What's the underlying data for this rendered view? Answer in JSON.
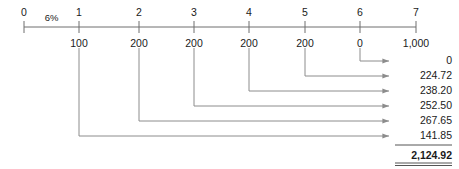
{
  "diagram": {
    "type": "timeline-cash-flow",
    "interest_rate_label": "6%",
    "timeline": {
      "ticks": [
        {
          "period": "0",
          "cash_flow": "",
          "x": 24
        },
        {
          "period": "1",
          "cash_flow": "100",
          "x": 79
        },
        {
          "period": "2",
          "cash_flow": "200",
          "x": 139
        },
        {
          "period": "3",
          "cash_flow": "200",
          "x": 194
        },
        {
          "period": "4",
          "cash_flow": "200",
          "x": 249
        },
        {
          "period": "5",
          "cash_flow": "200",
          "x": 305
        },
        {
          "period": "6",
          "cash_flow": "0",
          "x": 360
        },
        {
          "period": "7",
          "cash_flow": "1,000",
          "x": 416
        }
      ]
    },
    "present_values": [
      {
        "value": "0",
        "source_x": 360,
        "y": 61
      },
      {
        "value": "224.72",
        "source_x": 305,
        "y": 76
      },
      {
        "value": "238.20",
        "source_x": 249,
        "y": 91
      },
      {
        "value": "252.50",
        "source_x": 194,
        "y": 106
      },
      {
        "value": "267.65",
        "source_x": 139,
        "y": 121
      },
      {
        "value": "141.85",
        "source_x": 79,
        "y": 136
      }
    ],
    "total": "2,124.92",
    "colors": {
      "text": "#1a1a1a",
      "line": "#8c8c8c",
      "axis": "#6e6e6e"
    }
  }
}
